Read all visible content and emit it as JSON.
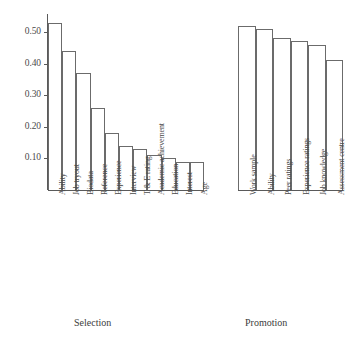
{
  "chart_data": {
    "type": "bar",
    "title": "",
    "subtitle": "",
    "xlabel": "",
    "ylabel": "",
    "ylim": [
      0,
      0.56
    ],
    "yticks": [
      "0.10",
      "0.20",
      "0.30",
      "0.40",
      "0.50"
    ],
    "ytick_values": [
      0.1,
      0.2,
      0.3,
      0.4,
      0.5
    ],
    "grid": false,
    "legend": "none",
    "groups": [
      {
        "name": "Selection",
        "caption": "Selection",
        "categories": [
          "Ability",
          "Job tryout",
          "Biodata",
          "Reference",
          "Experience",
          "Interview",
          "T & E rating",
          "Academic achievement",
          "Education",
          "Interest",
          "Age"
        ],
        "values": [
          0.53,
          0.44,
          0.37,
          0.26,
          0.18,
          0.14,
          0.13,
          0.11,
          0.1,
          0.09,
          0.09
        ]
      },
      {
        "name": "Promotion",
        "caption": "Promotion",
        "categories": [
          "Work sample",
          "Ability",
          "Peer ratings",
          "Experience ratings",
          "Job knowledge",
          "Assessment centre"
        ],
        "values": [
          0.52,
          0.51,
          0.48,
          0.47,
          0.46,
          0.41
        ]
      }
    ],
    "colors": {
      "bar_fill": "#ffffff",
      "bar_stroke": "#6b6b6b",
      "axis": "#5a5a5a",
      "text": "#4a4a4a",
      "background": "#ffffff"
    }
  }
}
